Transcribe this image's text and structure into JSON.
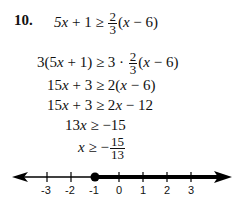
{
  "problem": {
    "number": "10.",
    "steps": [
      {
        "lhs": "5x + 1 ≥",
        "frac": {
          "num": "2",
          "den": "3"
        },
        "rhs": "(x − 6)"
      },
      {
        "lhs": "3(5x + 1) ≥ 3 ·",
        "frac": {
          "num": "2",
          "den": "3"
        },
        "rhs": "(x − 6)"
      },
      {
        "text": "15x + 3 ≥ 2(x − 6)"
      },
      {
        "text": "15x + 3 ≥ 2x − 12"
      },
      {
        "text": "13x ≥ −15"
      },
      {
        "lhs": "x ≥ −",
        "frac": {
          "num": "15",
          "den": "13"
        }
      }
    ]
  },
  "number_line": {
    "ticks": [
      "-3",
      "-2",
      "-1",
      "0",
      "1",
      "2",
      "3"
    ],
    "closed_point_value": "-15/13",
    "shaded_direction": "right",
    "color": "#000000"
  }
}
